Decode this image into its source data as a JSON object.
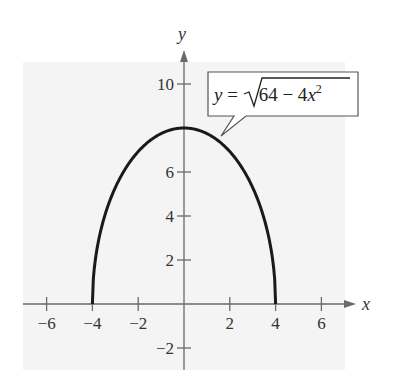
{
  "chart_data": {
    "type": "line",
    "title": "",
    "xlabel": "x",
    "ylabel": "y",
    "xlim": [
      -7,
      7.8
    ],
    "ylim": [
      -3,
      11.5
    ],
    "grid": false,
    "x_ticks": [
      -6,
      -4,
      -2,
      2,
      4,
      6
    ],
    "y_ticks": [
      -2,
      2,
      4,
      6,
      10
    ],
    "x_tick_labels": [
      "−6",
      "−4",
      "−2",
      "2",
      "4",
      "6"
    ],
    "y_tick_labels": [
      "−2",
      "2",
      "4",
      "6",
      "10"
    ],
    "series": [
      {
        "name": "y = √(64 − 4x²)",
        "function": "sqrt(64 - 4*x^2)",
        "domain": [
          -4,
          4
        ],
        "x": [
          -4,
          -3.5,
          -3,
          -2,
          -1,
          0,
          1,
          2,
          3,
          3.5,
          4
        ],
        "y": [
          0,
          3.87,
          5.29,
          6.93,
          7.75,
          8,
          7.75,
          6.93,
          5.29,
          3.87,
          0
        ]
      }
    ],
    "annotations": [
      {
        "text": "y = √(64 − 4x²)",
        "points_to": [
          1.5,
          7.42
        ],
        "style": "callout-box"
      }
    ]
  },
  "labels": {
    "x_axis": "x",
    "y_axis": "y",
    "eq_y": "y",
    "eq_eq": " = ",
    "eq_radicand": "64 − 4",
    "eq_x": "x",
    "eq_exp": "2"
  },
  "colors": {
    "background": "#f4f4f4",
    "curve": "#1a1a1a",
    "axis": "#6a6a6a"
  }
}
